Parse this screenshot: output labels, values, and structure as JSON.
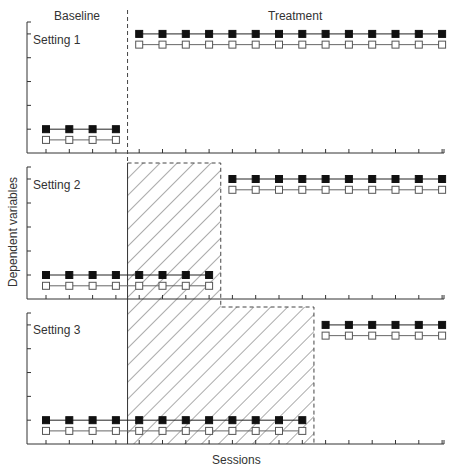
{
  "chart_data": {
    "type": "line",
    "xlabel": "Sessions",
    "ylabel": "Dependent variables",
    "phase_labels": [
      "Baseline",
      "Treatment"
    ],
    "grid": false,
    "legend": null,
    "series_styles": [
      {
        "name": "Filled-square series",
        "marker": "filled-square",
        "color": "#111111"
      },
      {
        "name": "Open-square series",
        "marker": "open-square",
        "color": "#555555"
      }
    ],
    "panels": [
      {
        "label": "Setting 1",
        "baseline_sessions": 4,
        "treatment_sessions": 14,
        "series": [
          {
            "name": "filled",
            "baseline_level": 1.0,
            "treatment_level": 5.0
          },
          {
            "name": "open",
            "baseline_level": 0.55,
            "treatment_level": 4.55
          }
        ],
        "ylim": [
          0,
          5.5
        ],
        "y_ticks": 5
      },
      {
        "label": "Setting 2",
        "baseline_sessions": 8,
        "treatment_sessions": 10,
        "series": [
          {
            "name": "filled",
            "baseline_level": 1.0,
            "treatment_level": 5.0
          },
          {
            "name": "open",
            "baseline_level": 0.55,
            "treatment_level": 4.55
          }
        ],
        "ylim": [
          0,
          5.5
        ],
        "y_ticks": 5
      },
      {
        "label": "Setting 3",
        "baseline_sessions": 12,
        "treatment_sessions": 6,
        "series": [
          {
            "name": "filled",
            "baseline_level": 1.0,
            "treatment_level": 5.0
          },
          {
            "name": "open",
            "baseline_level": 0.55,
            "treatment_level": 4.55
          }
        ],
        "ylim": [
          0,
          5.5
        ],
        "y_ticks": 5
      }
    ],
    "shaded_regions": [
      {
        "description": "Hatched region: Setting 1 treatment onset spanning sessions 5-8 in Setting 2 baseline",
        "panel": "Setting 2",
        "sessions": [
          5,
          8
        ]
      },
      {
        "description": "Hatched region spanning sessions 5-12 in Setting 3 baseline",
        "panel": "Setting 3",
        "sessions": [
          5,
          12
        ]
      }
    ],
    "total_sessions": 18
  },
  "labels": {
    "baseline": "Baseline",
    "treatment": "Treatment",
    "xlabel": "Sessions",
    "ylabel": "Dependent variables",
    "setting1": "Setting 1",
    "setting2": "Setting 2",
    "setting3": "Setting 3"
  }
}
